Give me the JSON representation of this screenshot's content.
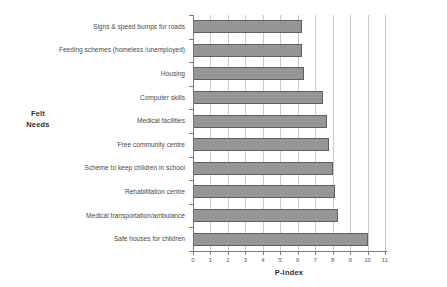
{
  "chart_data": {
    "type": "bar",
    "orientation": "horizontal",
    "title": "",
    "xlabel": "P-Index",
    "ylabel": "Felt\nNeeds",
    "ylabel_lines": [
      "Felt",
      "Needs"
    ],
    "xlim": [
      0,
      11
    ],
    "xticks": [
      0,
      1,
      2,
      3,
      4,
      5,
      6,
      7,
      8,
      9,
      10,
      11
    ],
    "xtick_labels": [
      "0",
      "1",
      "2",
      "3",
      "4",
      "5",
      "6",
      "7",
      "8",
      "9",
      "10",
      "11"
    ],
    "grid": true,
    "grid_axis": "x",
    "legend": false,
    "bar_color": "#969696",
    "bar_edge_color": "#5f5f5f",
    "categories": [
      "Signs & speed bumps for roads",
      "Feeding schemes (homeless /unemployed)",
      "Housing",
      "Computer skills",
      "Medical facilities",
      "Free community centre",
      "Scheme to keep children in school",
      "Rehabilitation centre",
      "Medical transportation/ambulance",
      "Safe houses for children"
    ],
    "values": [
      6.25,
      6.25,
      6.35,
      7.45,
      7.7,
      7.8,
      8.05,
      8.15,
      8.3,
      10.0
    ]
  }
}
